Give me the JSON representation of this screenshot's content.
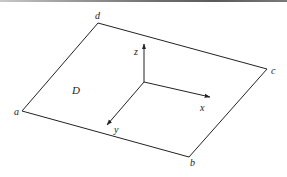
{
  "figure": {
    "type": "diagram",
    "colors": {
      "line": "#222222",
      "background": "#ffffff"
    },
    "region": {
      "label": "D",
      "label_pos": [
        72,
        94
      ],
      "vertices": [
        {
          "name": "a",
          "point": [
            22,
            111
          ],
          "label_pos": [
            14,
            115
          ]
        },
        {
          "name": "b",
          "point": [
            189,
            157
          ],
          "label_pos": [
            190,
            166
          ]
        },
        {
          "name": "c",
          "point": [
            267,
            69
          ],
          "label_pos": [
            271,
            74
          ]
        },
        {
          "name": "d",
          "point": [
            98,
            23
          ],
          "label_pos": [
            95,
            19
          ]
        }
      ]
    },
    "axes": {
      "origin": [
        144,
        82
      ],
      "items": [
        {
          "name": "x",
          "label": "x",
          "end": [
            210,
            97
          ],
          "label_pos": [
            200,
            111
          ]
        },
        {
          "name": "y",
          "label": "y",
          "end": [
            107,
            125
          ],
          "label_pos": [
            114,
            133
          ]
        },
        {
          "name": "z",
          "label": "z",
          "end": [
            144,
            44
          ],
          "label_pos": [
            134,
            55
          ]
        }
      ]
    }
  }
}
